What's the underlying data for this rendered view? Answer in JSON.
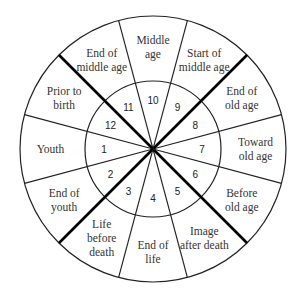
{
  "diagram": {
    "type": "wheel",
    "center": [
      153,
      149
    ],
    "outer_radius": 133,
    "inner_radius": 68,
    "line_color": "#222222",
    "thick_line_color": "#000000",
    "segments": [
      {
        "number": "1",
        "label": [
          "Youth"
        ]
      },
      {
        "number": "2",
        "label": [
          "End of",
          "youth"
        ]
      },
      {
        "number": "3",
        "label": [
          "Life",
          "before",
          "death"
        ]
      },
      {
        "number": "4",
        "label": [
          "End of",
          "life"
        ]
      },
      {
        "number": "5",
        "label": [
          "Image",
          "after death"
        ]
      },
      {
        "number": "6",
        "label": [
          "Before",
          "old age"
        ]
      },
      {
        "number": "7",
        "label": [
          "Toward",
          "old age"
        ]
      },
      {
        "number": "8",
        "label": [
          "End of",
          "old age"
        ]
      },
      {
        "number": "9",
        "label": [
          "Start of",
          "middle age"
        ]
      },
      {
        "number": "10",
        "label": [
          "Middle",
          "age"
        ]
      },
      {
        "number": "11",
        "label": [
          "End of",
          "middle age"
        ]
      },
      {
        "number": "12",
        "label": [
          "Prior to",
          "birth"
        ]
      }
    ]
  }
}
